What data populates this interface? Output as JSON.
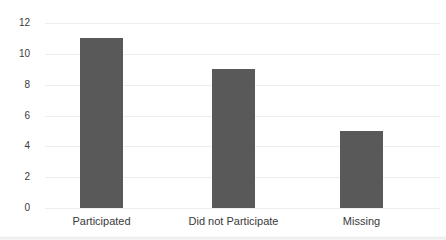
{
  "chart_data": {
    "type": "bar",
    "categories": [
      "Participated",
      "Did not Participate",
      "Missing"
    ],
    "values": [
      11,
      9,
      5
    ],
    "title": "",
    "xlabel": "",
    "ylabel": "",
    "ylim": [
      0,
      12
    ],
    "yticks": [
      0,
      2,
      4,
      6,
      8,
      10,
      12
    ],
    "grid": true,
    "legend": false,
    "bar_color": "#595959",
    "gridline_color": "#ededed",
    "tick_label_color": "#3a3a3a",
    "background_color": "#ffffff"
  }
}
